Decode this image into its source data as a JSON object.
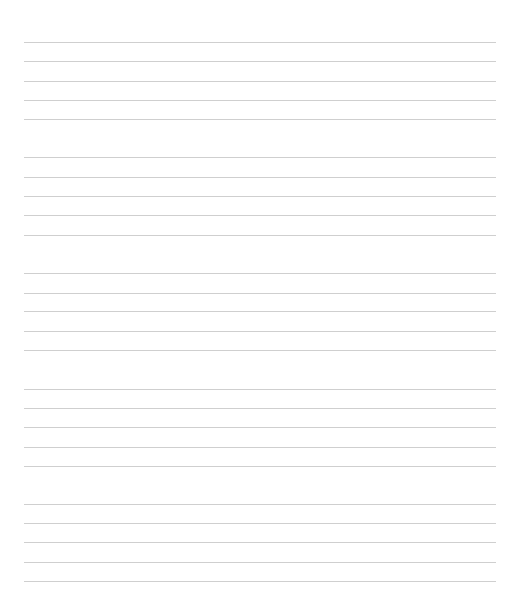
{
  "page": {
    "type": "ruled-paper",
    "line_color": "#cfcfcf",
    "line_left": 24,
    "line_right": 496,
    "groups": [
      {
        "lines": [
          42,
          61,
          81,
          100,
          119
        ]
      },
      {
        "lines": [
          157,
          177,
          196,
          215,
          235
        ]
      },
      {
        "lines": [
          273,
          293,
          311,
          331,
          350
        ]
      },
      {
        "lines": [
          389,
          408,
          427,
          447,
          466
        ]
      },
      {
        "lines": [
          504,
          523,
          542,
          562,
          581
        ]
      }
    ]
  }
}
